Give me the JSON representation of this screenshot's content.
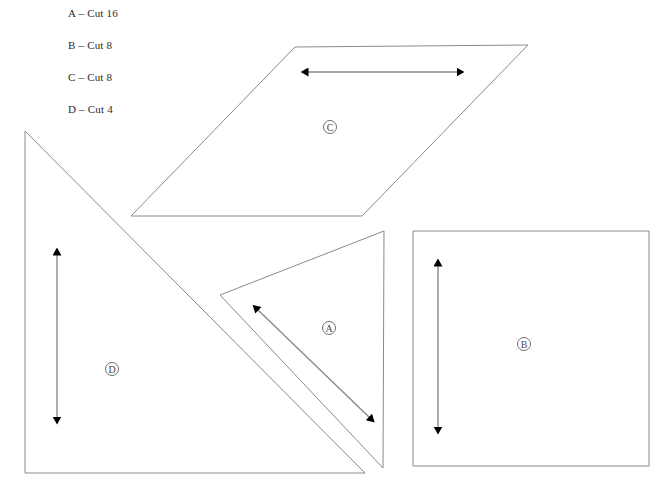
{
  "page": {
    "width": 671,
    "height": 497,
    "background": "#ffffff",
    "stroke_color": "#8a8a8a",
    "arrow_color": "#000000",
    "arrow_line_color": "#8a8a8a",
    "text_color": "#2b2b2b"
  },
  "legend": {
    "items": [
      {
        "label": "A – Cut 16",
        "piece": "A",
        "quantity": 16
      },
      {
        "label": "B – Cut 8",
        "piece": "B",
        "quantity": 8
      },
      {
        "label": "C – Cut 8",
        "piece": "C",
        "quantity": 8
      },
      {
        "label": "D – Cut 4",
        "piece": "D",
        "quantity": 4
      }
    ]
  },
  "shapes": {
    "a": {
      "label": "Ⓐ",
      "letter": "A",
      "type": "triangle",
      "points": "220,295 384,231 383,468",
      "label_pos": {
        "x": 329,
        "y": 328
      },
      "arrow": {
        "orientation": "diagonal",
        "x1": 258,
        "y1": 310,
        "x2": 370,
        "y2": 418
      }
    },
    "b": {
      "label": "Ⓑ",
      "letter": "B",
      "type": "square",
      "points": "413,231 649,231 649,466 413,466",
      "label_pos": {
        "x": 524,
        "y": 344
      },
      "arrow": {
        "orientation": "vertical",
        "x1": 438,
        "y1": 266,
        "x2": 438,
        "y2": 428
      }
    },
    "c": {
      "label": "Ⓒ",
      "letter": "C",
      "type": "parallelogram",
      "points": "295,47 528,45 362,216 131,216",
      "label_pos": {
        "x": 330,
        "y": 127
      },
      "arrow": {
        "orientation": "horizontal",
        "x1": 308,
        "y1": 72,
        "x2": 458,
        "y2": 72
      }
    },
    "d": {
      "label": "Ⓓ",
      "letter": "D",
      "type": "triangle",
      "points": "25,131 25,473 365,473",
      "label_pos": {
        "x": 112,
        "y": 369
      },
      "arrow": {
        "orientation": "vertical",
        "x1": 57,
        "y1": 255,
        "x2": 57,
        "y2": 418
      }
    }
  }
}
